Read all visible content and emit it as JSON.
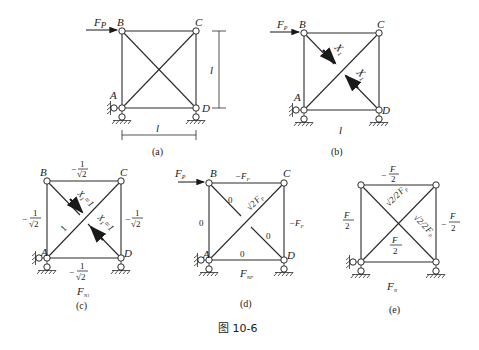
{
  "figure_caption": "图 10-6",
  "panels": {
    "a": {
      "caption": "(a)",
      "load": "F_P",
      "nodes": [
        "A",
        "B",
        "C",
        "D"
      ],
      "dimension_horizontal": "l",
      "dimension_vertical": "l"
    },
    "b": {
      "caption": "(b)",
      "load": "F_P",
      "nodes": [
        "A",
        "B",
        "C",
        "D"
      ],
      "redundant_labels": [
        "X₁",
        "X₁"
      ],
      "dimension_horizontal": "l"
    },
    "c": {
      "caption": "(c)",
      "diagram_label": "F_N1",
      "nodes": [
        "A",
        "B",
        "C",
        "D"
      ],
      "unit_force_labels": [
        "X₁=1",
        "X₁=1"
      ],
      "member_forces": {
        "BC": "−1/√2",
        "AB": "−1/√2",
        "CD": "−1/√2",
        "AD": "−1/√2",
        "AC": "1"
      }
    },
    "d": {
      "caption": "(d)",
      "diagram_label": "F_NP",
      "load": "F_P",
      "nodes": [
        "A",
        "B",
        "C",
        "D"
      ],
      "member_forces": {
        "BC": "−F_P",
        "AB": "0",
        "CD": "−F_P",
        "AD": "0",
        "AC": "√2 F_P",
        "BD_upper": "0",
        "BD_lower": "0"
      }
    },
    "e": {
      "caption": "(e)",
      "diagram_label": "F_N",
      "member_forces": {
        "BC": "−F_P/2",
        "AB": "F_P/2",
        "CD": "−F_P/2",
        "AD": "F_P/2",
        "AC": "(√2/2) F_P",
        "BD": "(√2/2) F_P"
      }
    }
  },
  "text": {
    "A": "A",
    "B": "B",
    "C": "C",
    "D": "D",
    "l": "l",
    "F": "F",
    "P": "P",
    "X": "X",
    "one": "1",
    "zero": "0",
    "minus": "−",
    "eq1": "=1",
    "sqrt2": "√2",
    "two": "2",
    "N1": "N1",
    "NP": "NP",
    "N": "N",
    "cap_a": "(a)",
    "cap_b": "(b)",
    "cap_c": "(c)",
    "cap_d": "(d)",
    "cap_e": "(e)"
  }
}
